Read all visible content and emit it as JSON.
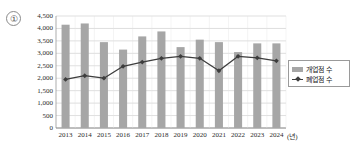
{
  "annotation": {
    "number_label": "①"
  },
  "legend": {
    "position": "right-middle",
    "entries": [
      {
        "label": "개업점 수",
        "type": "bar",
        "color": "#a6a6a6",
        "icon": "bar-swatch-icon"
      },
      {
        "label": "폐업점 수",
        "type": "line",
        "color": "#3d3d3d",
        "icon": "line-marker-swatch-icon"
      }
    ]
  },
  "chart_data": {
    "type": "bar",
    "title": "",
    "subtitle": "",
    "xlabel": "(년)",
    "ylabel": "",
    "grid": true,
    "ylim": [
      0,
      4500
    ],
    "yticks": [
      0,
      500,
      1000,
      1500,
      2000,
      2500,
      3000,
      3500,
      4000,
      4500
    ],
    "ytick_labels": [
      "0",
      "500",
      "1,000",
      "1,500",
      "2,000",
      "2,500",
      "3,000",
      "3,500",
      "4,000",
      "4,500"
    ],
    "categories": [
      "2013",
      "2014",
      "2015",
      "2016",
      "2017",
      "2018",
      "2019",
      "2020",
      "2021",
      "2022",
      "2023",
      "2024"
    ],
    "series": [
      {
        "name": "개업점 수",
        "type": "bar",
        "color": "#a6a6a6",
        "values": [
          4150,
          4200,
          3450,
          3150,
          3680,
          3880,
          3250,
          3550,
          3450,
          3050,
          3400,
          3400
        ]
      },
      {
        "name": "폐업점 수",
        "type": "line",
        "color": "#3d3d3d",
        "marker": "diamond",
        "values": [
          1950,
          2100,
          2000,
          2480,
          2650,
          2800,
          2880,
          2800,
          2300,
          2880,
          2820,
          2700
        ]
      }
    ]
  }
}
